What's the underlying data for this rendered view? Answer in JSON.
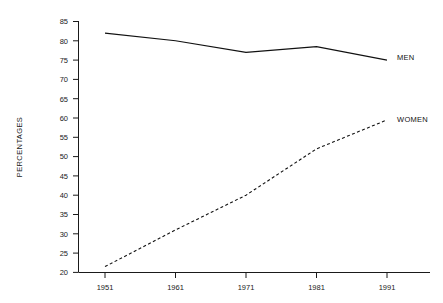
{
  "chart_data": {
    "type": "line",
    "title": "",
    "xlabel": "",
    "ylabel": "PERCENTAGES",
    "x": [
      1951,
      1961,
      1971,
      1981,
      1991
    ],
    "xtick_labels": [
      "1951",
      "1961",
      "1971",
      "1981",
      "1991"
    ],
    "ytick_labels": [
      "20",
      "25",
      "30",
      "35",
      "40",
      "45",
      "50",
      "55",
      "60",
      "65",
      "70",
      "75",
      "80",
      "85"
    ],
    "yticks": [
      20,
      25,
      30,
      35,
      40,
      45,
      50,
      55,
      60,
      65,
      70,
      75,
      80,
      85
    ],
    "ylim": [
      20,
      85
    ],
    "xlim": [
      1951,
      1991
    ],
    "grid": false,
    "legend_position": "inline-right-of-line-ends",
    "series": [
      {
        "name": "MEN",
        "label": "MEN",
        "style": "solid",
        "color": "#111111",
        "values": [
          82,
          80,
          77,
          78.5,
          75
        ]
      },
      {
        "name": "WOMEN",
        "label": "WOMEN",
        "style": "dashed",
        "color": "#111111",
        "values": [
          21.5,
          31,
          40,
          52,
          59.5
        ]
      }
    ]
  },
  "axes": {
    "y_axis_title": "PERCENTAGES"
  },
  "legend": {
    "men_label": "MEN",
    "women_label": "WOMEN"
  },
  "ticks": {
    "y": [
      "85",
      "80",
      "75",
      "70",
      "65",
      "60",
      "55",
      "50",
      "45",
      "40",
      "35",
      "30",
      "25",
      "20"
    ],
    "x": [
      "1951",
      "1961",
      "1971",
      "1981",
      "1991"
    ]
  }
}
